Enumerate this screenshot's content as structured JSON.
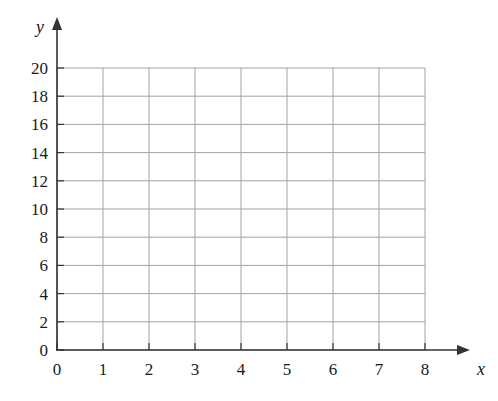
{
  "chart_data": {
    "type": "scatter",
    "title": "",
    "subtitle": "",
    "xlabel": "x",
    "ylabel": "y",
    "xlim": [
      0,
      8
    ],
    "ylim": [
      0,
      20
    ],
    "x_ticks": [
      0,
      1,
      2,
      3,
      4,
      5,
      6,
      7,
      8
    ],
    "y_ticks": [
      0,
      2,
      4,
      6,
      8,
      10,
      12,
      14,
      16,
      18,
      20
    ],
    "x_tick_labels": [
      "0",
      "1",
      "2",
      "3",
      "4",
      "5",
      "6",
      "7",
      "8"
    ],
    "y_tick_labels": [
      "0",
      "2",
      "4",
      "6",
      "8",
      "10",
      "12",
      "14",
      "16",
      "18",
      "20"
    ],
    "x_tick_step": 1,
    "y_tick_step": 2,
    "grid": true,
    "grid_x_lines": [
      0,
      1,
      2,
      3,
      4,
      5,
      6,
      7,
      8
    ],
    "grid_y_lines": [
      0,
      2,
      4,
      6,
      8,
      10,
      12,
      14,
      16,
      18,
      20
    ],
    "legend": null,
    "legend_position": "none",
    "series": [],
    "values": [],
    "categories": [],
    "annotations": []
  },
  "style": {
    "background_color": "#ffffff",
    "axis_color": "#333333",
    "grid_color": "#a3a3a3",
    "label_color": "#1a1a1a"
  },
  "geometry": {
    "origin_x": 57,
    "origin_y": 350,
    "x_unit_px": 46,
    "y_unit_px": 14.1,
    "plot_right_x": 425,
    "plot_top_y": 68,
    "x_axis_arrow_tip_x": 470,
    "y_axis_arrow_tip_y": 17
  },
  "axis_names": {
    "x": "x",
    "y": "y"
  }
}
